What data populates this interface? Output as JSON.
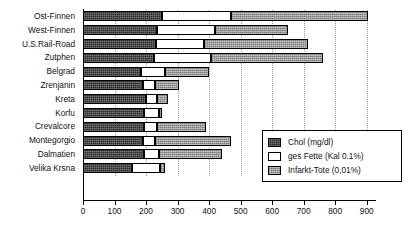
{
  "chart_data": {
    "type": "bar",
    "orientation": "horizontal",
    "stacked": true,
    "title": "",
    "xlabel": "",
    "ylabel": "",
    "xlim": [
      0,
      920
    ],
    "grid": true,
    "legend_position": "inside-right",
    "xticks": [
      0,
      100,
      200,
      300,
      400,
      500,
      600,
      700,
      800,
      900
    ],
    "xtick_labels": [
      "0",
      "100",
      "200",
      "300",
      "400",
      "500",
      "600",
      "700",
      "800",
      "900"
    ],
    "categories": [
      "Ost-Finnen",
      "West-Finnen",
      "U.S.Rail-Road",
      "Zutphen",
      "Belgrad",
      "Zrenjanin",
      "Kreta",
      "Korfu",
      "Crevalcore",
      "Montegorgio",
      "Dalmatien",
      "Velika Krsna"
    ],
    "series": [
      {
        "name": "Chol (mg/dl)",
        "color": "#2b2b2b",
        "values": [
          250,
          235,
          230,
          225,
          185,
          190,
          200,
          195,
          195,
          190,
          195,
          155
        ]
      },
      {
        "name": "ges Fette (Kal 0.1%)",
        "color": "#ffffff",
        "values": [
          220,
          185,
          155,
          180,
          75,
          40,
          35,
          45,
          40,
          40,
          45,
          90
        ]
      },
      {
        "name": "Infarkt-Tote (0,01%)",
        "color": "#9c9c9c",
        "values": [
          435,
          230,
          330,
          355,
          140,
          75,
          35,
          10,
          155,
          240,
          200,
          15
        ]
      }
    ],
    "totals": [
      905,
      650,
      715,
      760,
      400,
      305,
      270,
      250,
      390,
      470,
      440,
      260
    ]
  },
  "legend": {
    "items": [
      {
        "label": "Chol (mg/dl)",
        "swatch": "dark-stipple-swatch"
      },
      {
        "label": "ges Fette (Kal 0.1%)",
        "swatch": "white-swatch"
      },
      {
        "label": "Infarkt-Tote (0,01%)",
        "swatch": "gray-stipple-swatch"
      }
    ]
  }
}
